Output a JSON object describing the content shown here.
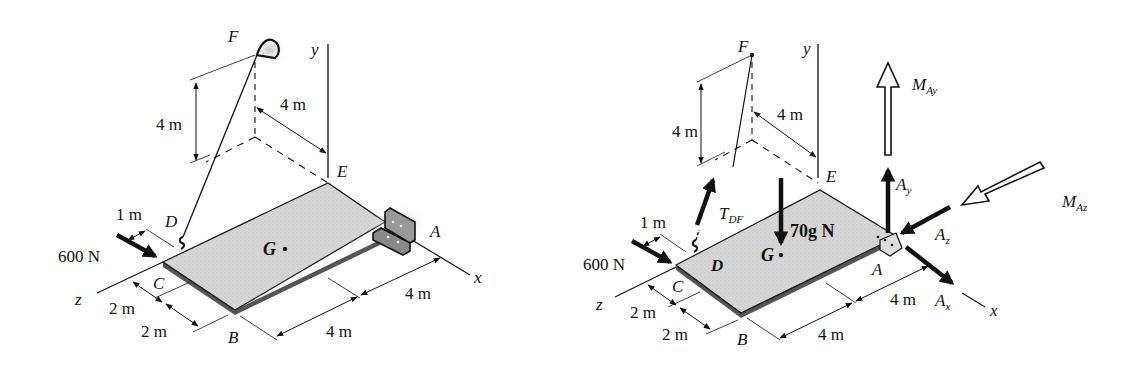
{
  "figure": {
    "colors": {
      "ink": "#111111",
      "plate": "#d9d9d9",
      "plate_edge": "#555555",
      "glow": "#cfcfcf"
    }
  },
  "left_diagram": {
    "points": {
      "F": "F",
      "E": "E",
      "D": "D",
      "C": "C",
      "B": "B",
      "A": "A",
      "G": "G"
    },
    "axes": {
      "x": "x",
      "y": "y",
      "z": "z"
    },
    "load": "600 N",
    "dims": {
      "vertical_F": "4 m",
      "F_to_y": "4 m",
      "C_to_D": "1 m",
      "z_seg1": "2 m",
      "z_seg2": "2 m",
      "x_seg1": "4 m",
      "x_seg2": "4 m"
    }
  },
  "right_diagram": {
    "points": {
      "F": "F",
      "E": "E",
      "D": "D",
      "C": "C",
      "B": "B",
      "A": "A",
      "G": "G"
    },
    "axes": {
      "x": "x",
      "y": "y",
      "z": "z"
    },
    "load": "600 N",
    "weight": "70g N",
    "forces": {
      "tension": {
        "main": "T",
        "sub": "DF"
      },
      "Ay": {
        "main": "A",
        "sub": "y"
      },
      "Ax": {
        "main": "A",
        "sub": "x"
      },
      "Az": {
        "main": "A",
        "sub": "z"
      },
      "MAy": {
        "main": "M",
        "sub": "Ay"
      },
      "MAz": {
        "main": "M",
        "sub": "Az"
      }
    },
    "dims": {
      "vertical_F": "4 m",
      "F_to_y": "4 m",
      "C_to_D": "1 m",
      "z_seg1": "2 m",
      "z_seg2": "2 m",
      "x_seg1": "4 m",
      "x_seg2": "4 m"
    }
  }
}
